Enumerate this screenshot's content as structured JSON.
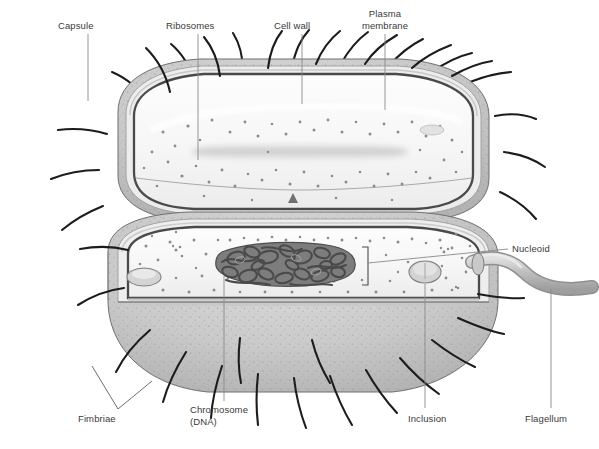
{
  "figure": {
    "organism": "rod-shaped bacterium (bacillus)",
    "view": "upper half intact exterior, lower half sectioned cutaway"
  },
  "labels": [
    {
      "id": "capsule",
      "text": "Capsule",
      "x": 58,
      "y": 20,
      "align": "left",
      "leader": {
        "type": "line",
        "x1": 88,
        "y1": 34,
        "x2": 88,
        "y2": 101
      }
    },
    {
      "id": "ribosomes",
      "text": "Ribosomes",
      "x": 166,
      "y": 20,
      "align": "left",
      "leader": {
        "type": "line",
        "x1": 198,
        "y1": 34,
        "x2": 198,
        "y2": 160
      }
    },
    {
      "id": "cell-wall",
      "text": "Cell wall",
      "x": 274,
      "y": 20,
      "align": "left",
      "leader": {
        "type": "line",
        "x1": 302,
        "y1": 34,
        "x2": 302,
        "y2": 104
      }
    },
    {
      "id": "plasma-membrane",
      "text": "Plasma\nmembrane",
      "x": 353,
      "y": 8,
      "align": "center",
      "leader": {
        "type": "line",
        "x1": 385,
        "y1": 34,
        "x2": 385,
        "y2": 110
      }
    },
    {
      "id": "nucleoid",
      "text": "Nucleoid",
      "x": 512,
      "y": 243,
      "align": "left",
      "leader": {
        "type": "line",
        "x1": 508,
        "y1": 249,
        "x2": 368,
        "y2": 263
      }
    },
    {
      "id": "fimbriae",
      "text": "Fimbriae",
      "x": 78,
      "y": 413,
      "align": "left",
      "leader": {
        "type": "bracket",
        "x1": 92,
        "y1": 366,
        "x2": 118,
        "y2": 409,
        "x3": 152,
        "y3": 381
      }
    },
    {
      "id": "chromosome",
      "text": "Chromosome\n(DNA)",
      "x": 190,
      "y": 404,
      "align": "left",
      "leader": {
        "type": "line",
        "x1": 224,
        "y1": 401,
        "x2": 224,
        "y2": 276
      }
    },
    {
      "id": "inclusion",
      "text": "Inclusion",
      "x": 408,
      "y": 413,
      "align": "left",
      "leader": {
        "type": "line",
        "x1": 425,
        "y1": 408,
        "x2": 425,
        "y2": 284
      }
    },
    {
      "id": "flagellum",
      "text": "Flagellum",
      "x": 525,
      "y": 413,
      "align": "left",
      "leader": {
        "type": "line",
        "x1": 551,
        "y1": 408,
        "x2": 551,
        "y2": 289
      }
    }
  ],
  "structures": {
    "capsule": "outermost stippled grey gelatinous layer surrounding the cell",
    "cell_wall": "pale layer beneath the capsule",
    "plasma_membrane": "dark inner boundary line enclosing the cytoplasm",
    "cytoplasm": "pale interior filled with fine ribosome dots",
    "ribosomes": "small dark dots scattered through the cytoplasm",
    "nucleoid": "irregular region occupied by the coiled chromosome",
    "chromosome_dna": "tangled mass of looped double-stranded DNA",
    "inclusion": "oval storage granule in the cytoplasm",
    "fimbriae": "numerous short thin hair-like projections over the surface",
    "flagellum": "single thick tubular whip-like appendage at the right pole"
  },
  "colors": {
    "capsule_fill": "#c9c9c9",
    "wall_fill": "#e8e8e8",
    "membrane_line": "#555555",
    "cytoplasm_fill": "#f7f7f7",
    "ribosome_dot": "#8c8c8c",
    "chromosome": "#6e6e6e",
    "flagellum_fill": "#bdbdbd",
    "fimbria_line": "#1c1c1c",
    "label_text": "#3a3a3a",
    "leader_line": "#8a8a8a",
    "background": "#ffffff"
  }
}
